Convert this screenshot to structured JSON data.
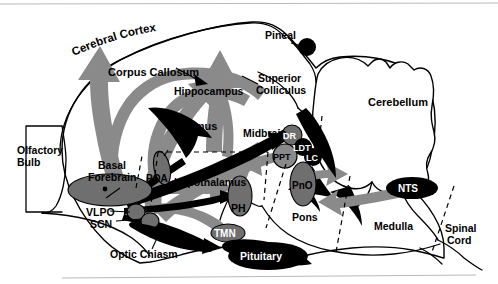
{
  "figure": {
    "type": "anatomical-diagram",
    "background": "#ffffff",
    "colors": {
      "outline": "#000000",
      "gray_arrow": "#8a8a8a",
      "dark_gray_structure": "#6f6f6f",
      "black_structure": "#000000",
      "white_text": "#ffffff"
    }
  },
  "labels": {
    "cerebral_cortex": "Cerebral Cortex",
    "corpus_callosum": "Corpus Callosum",
    "hippocampus": "Hippocampus",
    "thalamus": "Thalamus",
    "pineal": "Pineal",
    "superior_colliculus_1": "Superior",
    "superior_colliculus_2": "Colliculus",
    "cerebellum": "Cerebellum",
    "midbrain": "Midbrain",
    "olfactory_bulb_1": "Olfactory",
    "olfactory_bulb_2": "Bulb",
    "basal_forebrain_1": "Basal",
    "basal_forebrain_2": "Forebrain",
    "poa": "POA",
    "hypothalamus": "Hypothalamus",
    "vlpo": "VLPO",
    "scn": "SCN",
    "optic_chiasm": "Optic Chiasm",
    "ph": "PH",
    "tmn": "TMN",
    "pituitary": "Pituitary",
    "dr": "DR",
    "ldt": "LDT",
    "ppt": "PPT",
    "lc": "LC",
    "pno": "PnO",
    "pons": "Pons",
    "medulla": "Medulla",
    "nts": "NTS",
    "spinal_cord_1": "Spinal",
    "spinal_cord_2": "Cord"
  },
  "structures": [
    {
      "name": "Cerebral Cortex",
      "abbr": "",
      "style": "outline"
    },
    {
      "name": "Corpus Callosum",
      "abbr": "",
      "style": "gray-band"
    },
    {
      "name": "Hippocampus",
      "abbr": "",
      "style": "gray-band"
    },
    {
      "name": "Thalamus",
      "abbr": "",
      "style": "black-arrow"
    },
    {
      "name": "Pineal",
      "abbr": "",
      "style": "black-circle"
    },
    {
      "name": "Superior Colliculus",
      "abbr": "",
      "style": "outline"
    },
    {
      "name": "Cerebellum",
      "abbr": "",
      "style": "outline"
    },
    {
      "name": "Midbrain",
      "abbr": "",
      "style": "outline"
    },
    {
      "name": "Olfactory Bulb",
      "abbr": "",
      "style": "outline"
    },
    {
      "name": "Basal Forebrain",
      "abbr": "",
      "style": "gray-ellipse"
    },
    {
      "name": "Preoptic Area",
      "abbr": "POA",
      "style": "dashed-region"
    },
    {
      "name": "Hypothalamus",
      "abbr": "",
      "style": "dashed-region"
    },
    {
      "name": "Ventrolateral Preoptic Nucleus",
      "abbr": "VLPO",
      "style": "gray-ellipse-small"
    },
    {
      "name": "Suprachiasmatic Nucleus",
      "abbr": "SCN",
      "style": "gray-ellipse-small"
    },
    {
      "name": "Optic Chiasm",
      "abbr": "",
      "style": "black-shape"
    },
    {
      "name": "Posterior Hypothalamus",
      "abbr": "PH",
      "style": "gray-ellipse"
    },
    {
      "name": "Tuberomammillary Nucleus",
      "abbr": "TMN",
      "style": "gray-ellipse"
    },
    {
      "name": "Pituitary",
      "abbr": "",
      "style": "black-shape"
    },
    {
      "name": "Dorsal Raphe",
      "abbr": "DR",
      "style": "gray-circle"
    },
    {
      "name": "Laterodorsal Tegmental Nucleus",
      "abbr": "LDT",
      "style": "dark-circle"
    },
    {
      "name": "Pedunculopontine Tegmental Nucleus",
      "abbr": "PPT",
      "style": "outline-circle"
    },
    {
      "name": "Locus Coeruleus",
      "abbr": "LC",
      "style": "dark-circle"
    },
    {
      "name": "Pontine Reticular Nucleus Oral",
      "abbr": "PnO",
      "style": "gray-ellipse"
    },
    {
      "name": "Pons",
      "abbr": "",
      "style": "outline"
    },
    {
      "name": "Medulla",
      "abbr": "",
      "style": "outline"
    },
    {
      "name": "Nucleus Tractus Solitarius",
      "abbr": "NTS",
      "style": "black-ellipse"
    },
    {
      "name": "Spinal Cord",
      "abbr": "",
      "style": "outline"
    }
  ]
}
